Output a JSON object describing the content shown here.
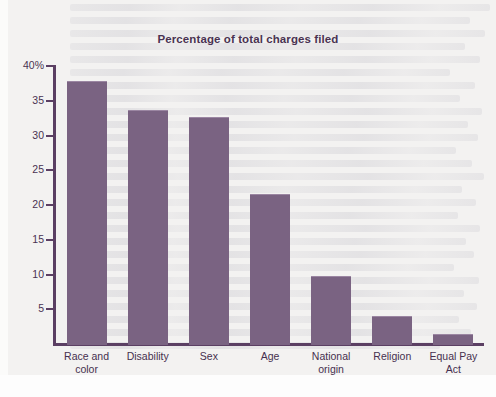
{
  "page": {
    "background_color": "#f3f2f1",
    "bottom_band_color": "#fdfdfd"
  },
  "chart": {
    "title": "Percentage of total charges filed",
    "title_color": "#4a3352",
    "bar_color": "#7a6382",
    "axis_color": "#5b3f63",
    "axis_label_color": "#46304f"
  },
  "chart_data": {
    "type": "bar",
    "title": "Percentage of total charges filed",
    "xlabel": "",
    "ylabel": "",
    "ylim": [
      0,
      41
    ],
    "grid": false,
    "legend": null,
    "yticks": [
      5,
      10,
      15,
      20,
      25,
      30,
      35,
      40
    ],
    "ytick_labels": [
      "5",
      "10",
      "15",
      "20",
      "25",
      "30",
      "35",
      "40%"
    ],
    "categories": [
      "Race and color",
      "Disability",
      "Sex",
      "Age",
      "National origin",
      "Religion",
      "Equal Pay Act"
    ],
    "category_lines": [
      [
        "Race and",
        "color"
      ],
      [
        "Disability"
      ],
      [
        "Sex"
      ],
      [
        "Age"
      ],
      [
        "National",
        "origin"
      ],
      [
        "Religion"
      ],
      [
        "Equal Pay",
        "Act"
      ]
    ],
    "values": [
      37.8,
      33.6,
      32.6,
      21.6,
      9.8,
      4.0,
      1.5
    ]
  }
}
